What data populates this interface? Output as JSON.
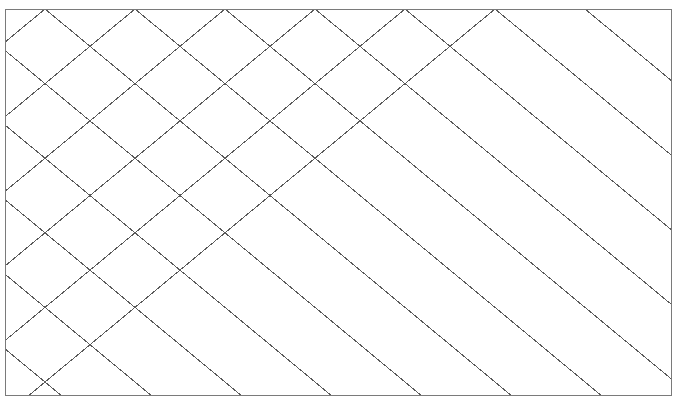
{
  "figure": {
    "title": "Diamond lattice grid",
    "kind": "geometric-line-pattern",
    "background_color": "#ffffff"
  },
  "canvas": {
    "width": 680,
    "height": 405
  },
  "frame": {
    "name": "plot-border",
    "x": 5,
    "y": 9,
    "width": 667,
    "height": 387,
    "stroke_color": "#7a7a7a",
    "stroke_width": 1
  },
  "lattice": {
    "description": "Two crossing families of parallel straight lines forming a rhombus (diamond) tiling",
    "stroke_color": "#5a5a5a",
    "stroke_width": 1,
    "cell_width": 90,
    "cell_height": 37.3,
    "half_cell_width": 45,
    "slope_down": 0.8289,
    "slope_up": -0.8289,
    "vertex_columns": [
      -45,
      0,
      45,
      90,
      135,
      180,
      225,
      270,
      315,
      360,
      405,
      450,
      495,
      540,
      585,
      630,
      675,
      720
    ],
    "vertex_rows": [
      0,
      37.3,
      74.6,
      111.9,
      149.2,
      186.5,
      223.8,
      261.1,
      298.4,
      335.7,
      373,
      410.3
    ],
    "row_count": 11,
    "column_count": 16
  },
  "chart_data": {
    "type": "line",
    "title": "Diamond lattice grid",
    "subtitle": "",
    "xlabel": "",
    "ylabel": "",
    "grid": true,
    "legend": "none",
    "xlim": [
      5,
      672
    ],
    "ylim": [
      9,
      396
    ],
    "xticks": [],
    "yticks": [],
    "annotations": [],
    "series": [
      {
        "name": "descending-diagonals",
        "slope": 0.8289,
        "spacing_x": 90,
        "count": 24,
        "color": "#5a5a5a"
      },
      {
        "name": "ascending-diagonals",
        "slope": -0.8289,
        "spacing_x": 90,
        "count": 24,
        "color": "#5a5a5a"
      }
    ]
  }
}
